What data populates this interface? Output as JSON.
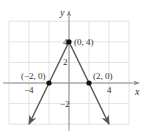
{
  "chart_data": {
    "type": "line",
    "title": "",
    "xlabel": "x",
    "ylabel": "y",
    "xlim": [
      -6,
      6
    ],
    "ylim": [
      -4,
      6
    ],
    "grid": true,
    "grid_step": 2,
    "x_ticks": [
      {
        "value": -4,
        "label": "−4"
      },
      {
        "value": 4,
        "label": "4"
      }
    ],
    "y_ticks": [
      {
        "value": 4,
        "label": "4"
      },
      {
        "value": 2,
        "label": "2"
      },
      {
        "value": -2,
        "label": "−2"
      }
    ],
    "series": [
      {
        "name": "y = 4 - 2|x|",
        "segments": [
          {
            "from": [
              -4,
              -4
            ],
            "to": [
              0,
              4
            ],
            "arrow_at": "from"
          },
          {
            "from": [
              0,
              4
            ],
            "to": [
              4,
              -4
            ],
            "arrow_at": "to"
          }
        ],
        "color": "#555555"
      }
    ],
    "points": [
      {
        "x": 0,
        "y": 4,
        "label": "(0, 4)",
        "label_pos": "right"
      },
      {
        "x": -2,
        "y": 0,
        "label": "(−2, 0)",
        "label_pos": "above-left"
      },
      {
        "x": 2,
        "y": 0,
        "label": "(2, 0)",
        "label_pos": "above-right"
      }
    ]
  },
  "colors": {
    "grid": "#dcdcdc",
    "axis": "#8a8a8a",
    "line": "#555555",
    "point": "#111111",
    "text": "#333333"
  }
}
